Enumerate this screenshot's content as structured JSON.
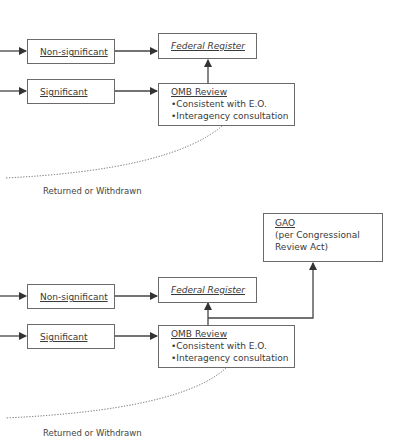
{
  "diagrams": [
    {
      "non_significant": "Non-significant",
      "significant": "Significant",
      "federal_register": "Federal Register",
      "omb_title": "OMB Review",
      "omb_bullets": [
        "•Consistent with E.O.",
        "•Interagency consultation"
      ],
      "returned": "Returned or Withdrawn"
    },
    {
      "non_significant": "Non-significant",
      "significant": "Significant",
      "federal_register": "Federal Register",
      "omb_title": "OMB Review",
      "omb_bullets": [
        "•Consistent with E.O.",
        "•Interagency consultation"
      ],
      "returned": "Returned or Withdrawn",
      "gao_title": "GAO",
      "gao_lines": [
        "(per Congressional",
        "Review Act)"
      ]
    }
  ],
  "colors": {
    "line": "#4a4a4a",
    "border": "#6a6a6a",
    "text": "#3a3a3a"
  }
}
